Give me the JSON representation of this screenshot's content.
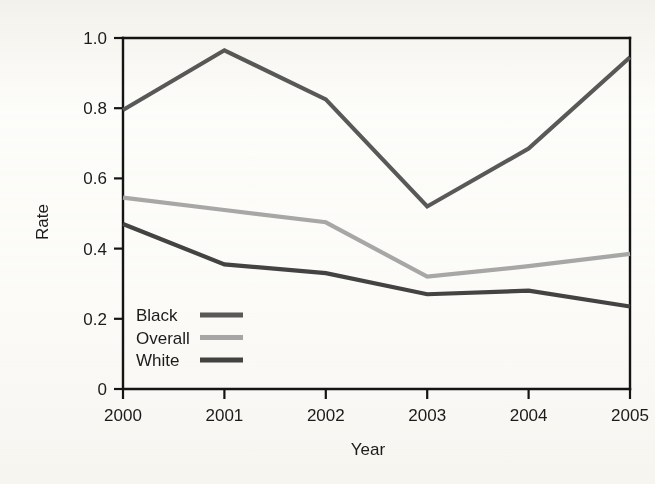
{
  "chart_data": {
    "type": "line",
    "title": "",
    "xlabel": "Year",
    "ylabel": "Rate",
    "categories": [
      "2000",
      "2001",
      "2002",
      "2003",
      "2004",
      "2005"
    ],
    "x": [
      2000,
      2001,
      2002,
      2003,
      2004,
      2005
    ],
    "xlim": [
      2000,
      2005
    ],
    "ylim": [
      0,
      1.0
    ],
    "ytick_labels": [
      "1.0",
      "0.8",
      "0.6",
      "0.4",
      "0.2",
      "0"
    ],
    "ytick_values": [
      1.0,
      0.8,
      0.6,
      0.4,
      0.2,
      0
    ],
    "xtick_labels": [
      "2000",
      "2001",
      "2002",
      "2003",
      "2004",
      "2005"
    ],
    "grid": false,
    "legend_position": "bottom-left",
    "series": [
      {
        "name": "Black",
        "color": "#595959",
        "values": [
          0.795,
          0.965,
          0.825,
          0.52,
          0.685,
          0.945
        ]
      },
      {
        "name": "Overall",
        "color": "#a8a8a8",
        "values": [
          0.545,
          0.51,
          0.475,
          0.32,
          0.35,
          0.385
        ]
      },
      {
        "name": "White",
        "color": "#434343",
        "values": [
          0.47,
          0.355,
          0.33,
          0.27,
          0.28,
          0.235
        ]
      }
    ]
  },
  "axes": {
    "y_label": "Rate",
    "x_label": "Year",
    "y_ticks": [
      {
        "label": "1.0",
        "value": 1.0
      },
      {
        "label": "0.8",
        "value": 0.8
      },
      {
        "label": "0.6",
        "value": 0.6
      },
      {
        "label": "0.4",
        "value": 0.4
      },
      {
        "label": "0.2",
        "value": 0.2
      },
      {
        "label": "0",
        "value": 0
      }
    ],
    "x_ticks": [
      {
        "label": "2000",
        "value": 2000
      },
      {
        "label": "2001",
        "value": 2001
      },
      {
        "label": "2002",
        "value": 2002
      },
      {
        "label": "2003",
        "value": 2003
      },
      {
        "label": "2004",
        "value": 2004
      },
      {
        "label": "2005",
        "value": 2005
      }
    ]
  },
  "legend": {
    "items": [
      {
        "label": "Black",
        "color": "#595959"
      },
      {
        "label": "Overall",
        "color": "#a8a8a8"
      },
      {
        "label": "White",
        "color": "#434343"
      }
    ]
  },
  "colors": {
    "background": "#fdfdfb",
    "axis": "#141414",
    "text": "#1b1b1b"
  }
}
